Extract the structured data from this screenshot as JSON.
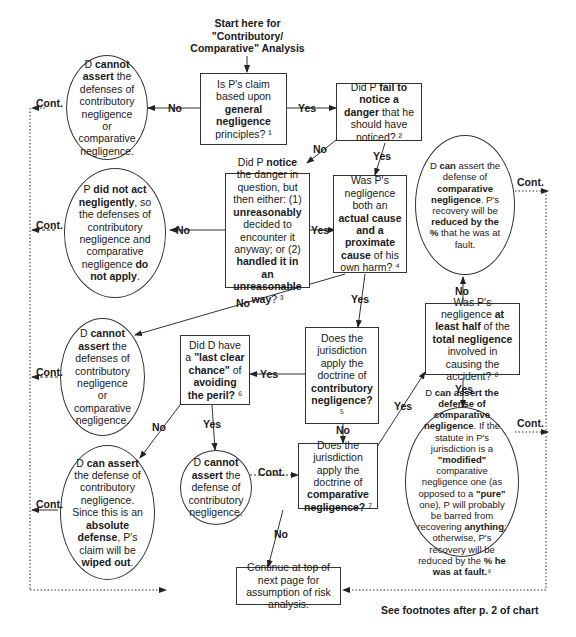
{
  "start": {
    "text": "Start here for \"Contributory/ Comparative\" Analysis"
  },
  "nodes": {
    "q1": {
      "parts": [
        "Is P's claim based upon ",
        "general negligence",
        " principles? ¹"
      ]
    },
    "q2": {
      "parts": [
        "Did P ",
        "fail to notice a danger",
        " that he should have noticed? ²"
      ]
    },
    "q3": {
      "parts": [
        "Did P ",
        "notice",
        " the danger in question, but then either: (1) ",
        "unreasonably",
        " decided to encounter it anyway; or (2) ",
        "handled it in an unreasonable way",
        "? ³"
      ]
    },
    "q4": {
      "parts": [
        "Was P's negligence both an ",
        "actual cause and a proximate cause",
        " of his own harm? ⁴"
      ]
    },
    "q5": {
      "parts": [
        "Does the jurisdiction apply the doctrine of ",
        "contributory negligence?",
        " ⁵"
      ]
    },
    "q6": {
      "parts": [
        "Did D have a ",
        "\"last clear chance\"",
        " of ",
        "avoiding the peril?",
        " ⁶"
      ]
    },
    "q7": {
      "parts": [
        "Does the jurisdiction apply the doctrine of ",
        "comparative negligence?",
        " ⁷"
      ]
    },
    "q8": {
      "parts": [
        "Was P's negligence ",
        "at least half",
        " of the ",
        "total negligence",
        " involved in causing the accident? ⁸"
      ]
    },
    "o1": {
      "parts": [
        "D ",
        "cannot assert",
        " the defenses of contributory negligence or comparative negligence."
      ]
    },
    "o2": {
      "parts": [
        "P ",
        "did not act negligently",
        ", so the defenses of contributory negligence and comparative negligence ",
        "do not apply",
        "."
      ]
    },
    "o3": {
      "parts": [
        "D ",
        "cannot assert",
        " the defenses of contributory negligence or comparative negligence."
      ]
    },
    "o4": {
      "parts": [
        "D ",
        "can assert",
        " the defense of contributory negligence. Since this is an ",
        "absolute defense",
        ", P's claim will be ",
        "wiped out",
        "."
      ]
    },
    "o5": {
      "parts": [
        "D ",
        "cannot assert",
        " the defense of contributory negligence."
      ]
    },
    "o6": {
      "parts": [
        "D ",
        "can",
        " assert the defense of ",
        "comparative negligence",
        ". P's recovery will be ",
        "reduced by the %",
        " that he was at fault."
      ]
    },
    "o7": {
      "parts": [
        "D ",
        "can assert the defense of comparative negligence",
        ". If the statute in P's jurisdiction is a ",
        "\"modified\"",
        " comparative negligence one (as opposed to a ",
        "\"pure\"",
        " one), P will probably be barred from recovering ",
        "anything",
        "; otherwise, P's recovery will be reduced by the ",
        "% he was at fault.",
        "⁹"
      ]
    },
    "end": {
      "parts": [
        "Continue at top of next page for assumption of risk analysis."
      ]
    }
  },
  "labels": {
    "yes": "Yes",
    "no": "No",
    "cont": "Cont."
  },
  "footer": "See footnotes after p. 2 of chart"
}
